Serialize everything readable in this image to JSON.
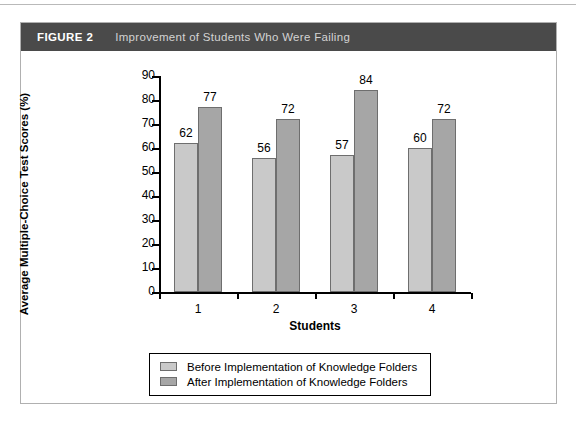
{
  "figure": {
    "label": "FIGURE 2",
    "title": "Improvement of Students Who Were Failing",
    "header_bg": "#4a4a4a",
    "label_color": "#ffffff",
    "title_color": "#d3d3d3"
  },
  "chart_data": {
    "type": "bar",
    "title": "Improvement of Students Who Were Failing",
    "xlabel": "Students",
    "ylabel": "Average Multiple-Choice Test Scores (%)",
    "categories": [
      "1",
      "2",
      "3",
      "4"
    ],
    "series": [
      {
        "name": "Before Implementation of Knowledge Folders",
        "color": "#c9c9c9",
        "values": [
          62,
          56,
          57,
          60
        ]
      },
      {
        "name": "After Implementation of Knowledge Folders",
        "color": "#a6a6a6",
        "values": [
          77,
          72,
          84,
          72
        ]
      }
    ],
    "ylim": [
      0,
      90
    ],
    "ytick_labels": [
      "90",
      "80",
      "70",
      "60",
      "50",
      "40",
      "30",
      "20",
      "10",
      "0"
    ],
    "ytick_values": [
      90,
      80,
      70,
      60,
      50,
      40,
      30,
      20,
      10,
      0
    ],
    "grid": false,
    "legend_position": "bottom",
    "data_labels": true,
    "bar_border_color": "#6e6e6e",
    "axis_color": "#000000"
  },
  "legend": {
    "items": [
      {
        "label": "Before Implementation of Knowledge Folders",
        "color": "#c9c9c9"
      },
      {
        "label": "After Implementation of Knowledge Folders",
        "color": "#a6a6a6"
      }
    ]
  }
}
